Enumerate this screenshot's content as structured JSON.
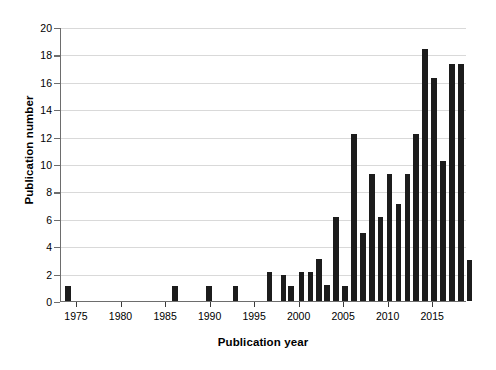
{
  "chart_data": {
    "type": "bar",
    "title": "",
    "xlabel": "Publication year",
    "ylabel": "Publication number",
    "xlim": [
      1973.2,
      2018.8
    ],
    "ylim": [
      0,
      20
    ],
    "ytick_step": 2,
    "grid": true,
    "legend": false,
    "bar_color": "#1c1c1c",
    "axis_color": "#6d6d6d",
    "grid_color": "#d9d9d9",
    "yticks": [
      0,
      2,
      4,
      6,
      8,
      10,
      12,
      14,
      16,
      18,
      20
    ],
    "ytick_labels": [
      "0",
      "2",
      "4",
      "6",
      "8",
      "10",
      "12",
      "14",
      "16",
      "18",
      "20"
    ],
    "xticks": [
      1975,
      1980,
      1985,
      1990,
      1995,
      2000,
      2005,
      2010,
      2015
    ],
    "xtick_labels": [
      "1975",
      "1980",
      "1985",
      "1990",
      "1995",
      "2000",
      "2005",
      "2010",
      "2015"
    ],
    "categories": [
      1974,
      1986,
      1990,
      1993,
      1996,
      1998,
      1999,
      2000,
      2001,
      2002,
      2003,
      2004,
      2005,
      2006,
      2007,
      2008,
      2009,
      2010,
      2011,
      2012,
      2013,
      2014,
      2015,
      2016,
      2017,
      2018
    ],
    "values": [
      1.1,
      1.1,
      1.1,
      1.1,
      2.1,
      1.9,
      1.1,
      1.2,
      2.1,
      2.1,
      3.1,
      1.2,
      6.1,
      1.1,
      12.2,
      5.0,
      9.3,
      6.1,
      9.3,
      7.1,
      9.3,
      12.2,
      18.4,
      16.3,
      10.2,
      17.3
    ],
    "series": [
      {
        "name": "Publication number",
        "points": [
          {
            "x": 1974,
            "y": 1.1
          },
          {
            "x": 1986,
            "y": 1.1
          },
          {
            "x": 1990,
            "y": 1.1
          },
          {
            "x": 1993,
            "y": 1.1
          },
          {
            "x": 1996,
            "y": 2.1
          },
          {
            "x": 1997,
            "y": 1.9
          },
          {
            "x": 1998,
            "y": 1.1
          },
          {
            "x": 1999,
            "y": 1.2
          },
          {
            "x": 2000,
            "y": 2.1
          },
          {
            "x": 2001,
            "y": 2.1
          },
          {
            "x": 2002,
            "y": 3.1
          },
          {
            "x": 2003,
            "y": 1.2
          },
          {
            "x": 2004,
            "y": 6.1
          },
          {
            "x": 2005,
            "y": 1.1
          },
          {
            "x": 2006,
            "y": 12.2
          },
          {
            "x": 2007,
            "y": 5.0
          },
          {
            "x": 2008,
            "y": 9.3
          },
          {
            "x": 2009,
            "y": 6.1
          },
          {
            "x": 2010,
            "y": 9.3
          },
          {
            "x": 2011,
            "y": 7.1
          },
          {
            "x": 2012,
            "y": 9.3
          },
          {
            "x": 2013,
            "y": 12.2
          },
          {
            "x": 2014,
            "y": 18.4
          },
          {
            "x": 2015,
            "y": 16.3
          },
          {
            "x": 2016,
            "y": 10.2
          },
          {
            "x": 2017,
            "y": 17.3
          },
          {
            "x": 2018,
            "y": 17.3
          },
          {
            "x": 2019,
            "y": 3.0
          }
        ]
      }
    ],
    "bars": [
      {
        "x": 1974.0,
        "y": 1.1
      },
      {
        "x": 1986.0,
        "y": 1.1
      },
      {
        "x": 1989.8,
        "y": 1.1
      },
      {
        "x": 1992.8,
        "y": 1.1
      },
      {
        "x": 1996.6,
        "y": 2.1
      },
      {
        "x": 1998.2,
        "y": 1.9
      },
      {
        "x": 1999.0,
        "y": 1.1
      },
      {
        "x": 2000.2,
        "y": 2.1
      },
      {
        "x": 2001.2,
        "y": 2.1
      },
      {
        "x": 2002.2,
        "y": 3.1
      },
      {
        "x": 2003.1,
        "y": 1.2
      },
      {
        "x": 2004.1,
        "y": 6.1
      },
      {
        "x": 2005.1,
        "y": 1.1
      },
      {
        "x": 2006.1,
        "y": 12.2
      },
      {
        "x": 2007.1,
        "y": 5.0
      },
      {
        "x": 2008.1,
        "y": 9.3
      },
      {
        "x": 2009.1,
        "y": 6.1
      },
      {
        "x": 2010.1,
        "y": 9.3
      },
      {
        "x": 2011.1,
        "y": 7.1
      },
      {
        "x": 2012.1,
        "y": 9.3
      },
      {
        "x": 2013.1,
        "y": 12.2
      },
      {
        "x": 2014.1,
        "y": 18.4
      },
      {
        "x": 2015.1,
        "y": 16.3
      },
      {
        "x": 2016.1,
        "y": 10.2
      },
      {
        "x": 2017.1,
        "y": 17.3
      },
      {
        "x": 2018.1,
        "y": 17.3
      },
      {
        "x": 2019.1,
        "y": 3.0
      }
    ]
  }
}
